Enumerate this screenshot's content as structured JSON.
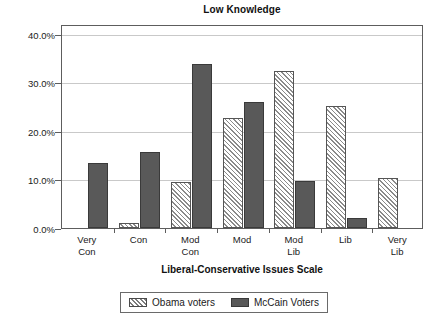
{
  "chart_data": {
    "type": "bar",
    "title": "Low Knowledge",
    "xlabel": "Liberal-Conservative Issues Scale",
    "ylabel": "",
    "categories": [
      "Very Con",
      "Con",
      "Mod Con",
      "Mod",
      "Mod Lib",
      "Lib",
      "Very Lib"
    ],
    "category_lines": [
      [
        "Very",
        "Con"
      ],
      [
        "Con",
        ""
      ],
      [
        "Mod",
        "Con"
      ],
      [
        "Mod",
        ""
      ],
      [
        "Mod",
        "Lib"
      ],
      [
        "Lib",
        ""
      ],
      [
        "Very",
        "Lib"
      ]
    ],
    "series": [
      {
        "name": "Obama voters",
        "values": [
          0.0,
          1.0,
          9.5,
          22.7,
          32.4,
          25.1,
          10.2
        ],
        "color": "#ffffff",
        "pattern": "diagonal-hatch"
      },
      {
        "name": "McCain Voters",
        "values": [
          13.3,
          15.7,
          33.8,
          26.0,
          9.7,
          2.1,
          0.0
        ],
        "color": "#595959",
        "pattern": "solid"
      }
    ],
    "ylim": [
      0,
      42
    ],
    "yticks": [
      0,
      10,
      20,
      30,
      40
    ],
    "ytick_labels": [
      "0.0%",
      "10.0%",
      "20.0%",
      "30.0%",
      "40.0%"
    ],
    "grid": "horizontal",
    "legend_position": "bottom",
    "value_unit": "percent"
  },
  "legend": {
    "entries": [
      {
        "label": "Obama voters",
        "swatch": "hatched-swatch"
      },
      {
        "label": "McCain Voters",
        "swatch": "solid-dark-swatch"
      }
    ]
  }
}
